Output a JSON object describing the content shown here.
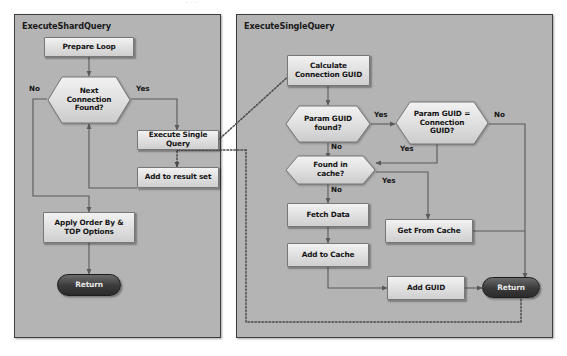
{
  "diagram": {
    "title_artifact": "·  ·  ·",
    "panels": [
      {
        "id": "shard",
        "title": "ExecuteShardQuery"
      },
      {
        "id": "single",
        "title": "ExecuteSingleQuery"
      }
    ]
  },
  "shard": {
    "nodes": {
      "prepare_loop": "Prepare Loop",
      "next_connection": "Next\nConnection\nFound?",
      "execute_single": "Execute Single Query",
      "add_result": "Add to result set",
      "apply_order": "Apply Order By &\nTOP Options",
      "return": "Return"
    },
    "edge_labels": {
      "no": "No",
      "yes": "Yes"
    }
  },
  "single": {
    "nodes": {
      "calculate_guid": "Calculate\nConnection GUID",
      "param_found": "Param GUID\nfound?",
      "param_equals": "Param GUID =\nConnection\nGUID?",
      "found_cache": "Found in\ncache?",
      "fetch_data": "Fetch Data",
      "add_cache": "Add to Cache",
      "get_from_cache": "Get From Cache",
      "add_guid": "Add GUID",
      "return": "Return"
    },
    "edge_labels": {
      "param_found_yes": "Yes",
      "param_found_no": "No",
      "param_eq_no": "No",
      "param_eq_yes": "Yes",
      "cache_yes": "Yes",
      "cache_no": "No"
    }
  },
  "colors": {
    "panel_fill": "#b4b4b4",
    "panel_border": "#3d3d3d",
    "node_fill": "#e2e2e2",
    "node_border": "#777777",
    "terminator": "#3a3a3a",
    "connector": "#5a5a5a",
    "dotted": "#4a4a4a"
  }
}
